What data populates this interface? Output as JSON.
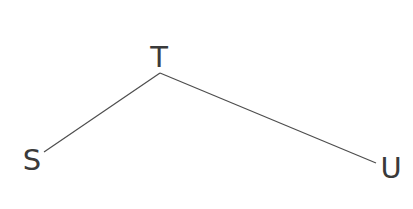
{
  "diagram": {
    "type": "tree",
    "colors": {
      "edge": "#4d4d4d",
      "label": "#3a3a3a",
      "background": "#ffffff"
    },
    "nodes": [
      {
        "id": "S",
        "label": "S",
        "x": 32,
        "y": 170
      },
      {
        "id": "T",
        "label": "T",
        "x": 159,
        "y": 67
      },
      {
        "id": "U",
        "label": "U",
        "x": 391,
        "y": 178
      }
    ],
    "edges": [
      {
        "from": "T",
        "to": "S",
        "x1": 160,
        "y1": 73,
        "x2": 44,
        "y2": 152
      },
      {
        "from": "T",
        "to": "U",
        "x1": 160,
        "y1": 73,
        "x2": 376,
        "y2": 163
      }
    ]
  }
}
